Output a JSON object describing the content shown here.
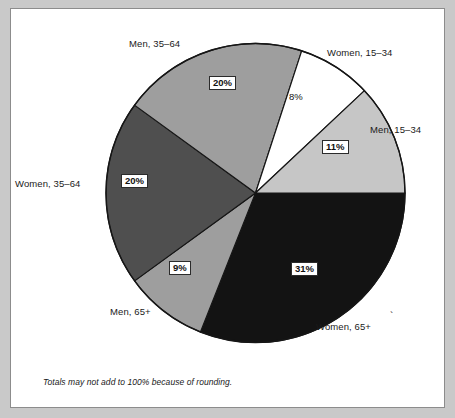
{
  "figure": {
    "background_color": "#ffffff",
    "page_color": "#c9c9c9",
    "border_color": "#8c8c8c"
  },
  "footnote": {
    "text": "Totals may not add to 100% because of rounding."
  },
  "decoration": {
    "tick_mark": "`"
  },
  "chart_data": {
    "type": "pie",
    "title": "",
    "xlabel": "",
    "ylabel": "",
    "legend_position": "none",
    "grid": false,
    "start_angle_deg": 0,
    "direction": "clockwise",
    "units": "percent",
    "categories": [
      "Women, 65+",
      "Men, 65+",
      "Women, 35–64",
      "Men, 35–64",
      "Women, 15–34",
      "Men, 15–34"
    ],
    "values": [
      31,
      9,
      20,
      20,
      8,
      11
    ],
    "value_labels": [
      "31%",
      "9%",
      "20%",
      "20%",
      "8%",
      "11%"
    ],
    "colors": [
      "#131313",
      "#9e9e9e",
      "#4f4f4f",
      "#9e9e9e",
      "#ffffff",
      "#c6c6c6"
    ],
    "slices": [
      {
        "name": "Women, 65+",
        "label": "Women, 65+",
        "value": 31,
        "value_label": "31%",
        "color": "#131313",
        "label_style": "boxed-white",
        "start_deg": 0,
        "end_deg": 111.6
      },
      {
        "name": "Men, 65+",
        "label": "Men, 65+",
        "value": 9,
        "value_label": "9%",
        "color": "#9e9e9e",
        "label_style": "boxed-white",
        "start_deg": 111.6,
        "end_deg": 144.0
      },
      {
        "name": "Women, 35–64",
        "label": "Women, 35–64",
        "value": 20,
        "value_label": "20%",
        "color": "#4f4f4f",
        "label_style": "boxed-white",
        "start_deg": 144.0,
        "end_deg": 216.0
      },
      {
        "name": "Men, 35–64",
        "label": "Men, 35–64",
        "value": 20,
        "value_label": "20%",
        "color": "#9e9e9e",
        "label_style": "boxed-white",
        "start_deg": 216.0,
        "end_deg": 288.0
      },
      {
        "name": "Women, 15–34",
        "label": "Women, 15–34",
        "value": 8,
        "value_label": "8%",
        "color": "#ffffff",
        "label_style": "plain",
        "start_deg": 288.0,
        "end_deg": 316.8
      },
      {
        "name": "Men, 15–34",
        "label": "Men, 15–34",
        "value": 11,
        "value_label": "11%",
        "color": "#c6c6c6",
        "label_style": "boxed-white",
        "start_deg": 316.8,
        "end_deg": 360.0
      }
    ],
    "note": "Totals may not add to 100% because of rounding."
  }
}
